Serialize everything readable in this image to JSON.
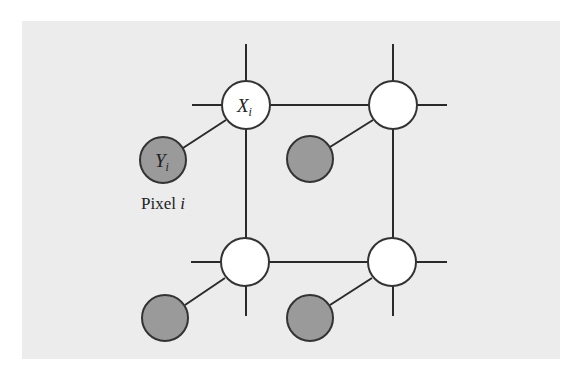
{
  "diagram": {
    "type": "markov-random-field",
    "colors": {
      "panel_background": "#ececec",
      "hidden_node_fill": "#ffffff",
      "observed_node_fill": "#9a9a9a",
      "edge_stroke": "#2a2a2a"
    },
    "hidden_nodes": [
      {
        "id": "x_top_left",
        "label": "X",
        "subscript": "i",
        "cx": 246,
        "cy": 105
      },
      {
        "id": "x_top_right",
        "label": "",
        "subscript": "",
        "cx": 393,
        "cy": 105
      },
      {
        "id": "x_bottom_left",
        "label": "",
        "subscript": "",
        "cx": 245,
        "cy": 262
      },
      {
        "id": "x_bottom_right",
        "label": "",
        "subscript": "",
        "cx": 392,
        "cy": 262
      }
    ],
    "observed_nodes": [
      {
        "id": "y_top_left",
        "label": "Y",
        "subscript": "i",
        "cx": 163,
        "cy": 160
      },
      {
        "id": "y_top_right",
        "label": "",
        "subscript": "",
        "cx": 310,
        "cy": 159
      },
      {
        "id": "y_bottom_left",
        "label": "",
        "subscript": "",
        "cx": 165,
        "cy": 318
      },
      {
        "id": "y_bottom_right",
        "label": "",
        "subscript": "",
        "cx": 310,
        "cy": 318
      }
    ],
    "caption": {
      "text": "Pixel ",
      "italic": "i"
    }
  }
}
